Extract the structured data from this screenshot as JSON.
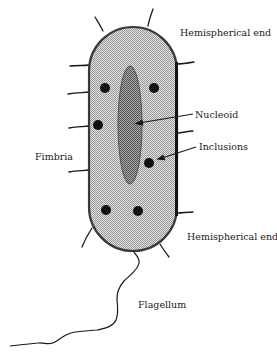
{
  "diagram": {
    "labels": {
      "top_end": "Hemispherical end",
      "nucleoid": "Nucleoid",
      "inclusions": "Inclusions",
      "fimbria": "Fimbria",
      "bottom_end": "Hemispherical end",
      "flagellum": "Flagellum"
    },
    "colors": {
      "cell_fill": "#c8c8c8",
      "cell_outline": "#3a3a3a",
      "nucleoid_fill": "#8a8a8a",
      "inclusion_fill": "#111111",
      "line": "#1a1a1a"
    }
  }
}
